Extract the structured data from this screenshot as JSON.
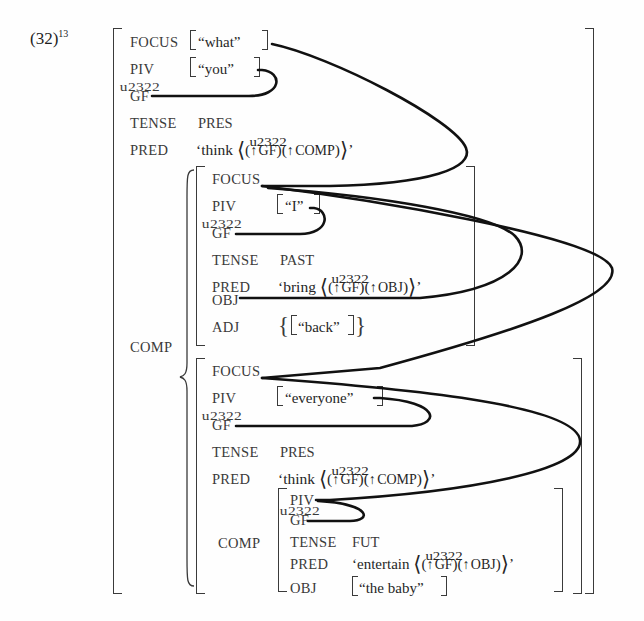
{
  "example": {
    "number": "(32)",
    "footnote": "13"
  },
  "labels": {
    "focus": "FOCUS",
    "piv": "PIV",
    "gf": "GF",
    "tense": "TENSE",
    "pred": "PRED",
    "obj": "OBJ",
    "adj": "ADJ",
    "comp": "COMP"
  },
  "structures": {
    "outer": {
      "focus_value": "“what”",
      "piv_value": "“you”",
      "gf_value": "",
      "tense_value": "PRES",
      "pred_head": "‘think",
      "pred_arg1": "GF",
      "pred_arg2": "COMP",
      "pred_close": "’",
      "comp_label": "COMP"
    },
    "inner_a": {
      "focus_value": "",
      "piv_value": "“I”",
      "gf_value": "",
      "tense_value": "PAST",
      "pred_head": "‘bring",
      "pred_arg1": "GF",
      "pred_arg2": "OBJ",
      "pred_close": "’",
      "obj_value": "",
      "adj_value": "“back”"
    },
    "inner_b": {
      "focus_value": "",
      "piv_value": "“everyone”",
      "gf_value": "",
      "tense_value": "PRES",
      "pred_head": "‘think",
      "pred_arg1": "GF",
      "pred_arg2": "COMP",
      "pred_close": "’",
      "comp_label": "COMP"
    },
    "inner_c": {
      "piv_value": "",
      "gf_value": "",
      "tense_value": "FUT",
      "pred_head": "‘entertain",
      "pred_arg1": "GF",
      "pred_arg2": "OBJ",
      "pred_close": "’",
      "obj_value": "“the baby”"
    }
  },
  "symbols": {
    "up_arrow": "↑",
    "angle_open": "⟨",
    "angle_close": "⟩",
    "paren_open": "(",
    "paren_close": ")",
    "brace_open": "{",
    "brace_close": "}"
  },
  "colors": {
    "background": "#fefefe",
    "ink": "#2b2b2b",
    "label_ink": "#3a3a3a",
    "curve": "#111111"
  }
}
